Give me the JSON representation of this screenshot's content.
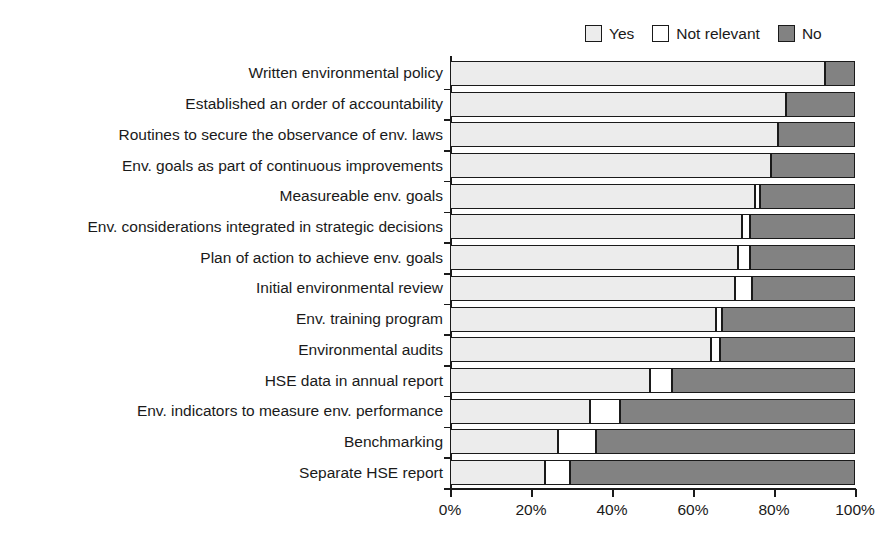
{
  "chart_data": {
    "type": "bar",
    "orientation": "horizontal",
    "stacked": true,
    "title": "",
    "subtitle": "",
    "xlabel": "",
    "ylabel": "",
    "xlim": [
      0,
      100
    ],
    "grid": false,
    "legend_position": "top-right",
    "xticks": [
      "0%",
      "20%",
      "40%",
      "60%",
      "80%",
      "100%"
    ],
    "xtick_values": [
      0,
      20,
      40,
      60,
      80,
      100
    ],
    "categories": [
      "Written environmental policy",
      "Established an order of accountability",
      "Routines to secure the observance of env. laws",
      "Env. goals as part of continuous improvements",
      "Measureable env. goals",
      "Env. considerations integrated in strategic decisions",
      "Plan of action to achieve env. goals",
      "Initial environmental review",
      "Env. training program",
      "Environmental audits",
      "HSE data in annual report",
      "Env. indicators to measure env. performance",
      "Benchmarking",
      "Separate HSE report"
    ],
    "series": [
      {
        "name": "Yes",
        "color": "#ececec",
        "values": [
          92.6,
          83.0,
          81.0,
          79.3,
          75.3,
          72.1,
          71.1,
          70.4,
          65.7,
          64.4,
          49.4,
          34.6,
          26.7,
          23.5
        ]
      },
      {
        "name": "Not relevant",
        "color": "#ffffff",
        "values": [
          0.0,
          0.0,
          0.0,
          0.0,
          1.2,
          2.0,
          3.0,
          4.2,
          1.5,
          2.2,
          5.4,
          7.4,
          9.4,
          6.2
        ]
      },
      {
        "name": "No",
        "color": "#828282",
        "values": [
          7.4,
          17.0,
          19.0,
          20.7,
          23.5,
          25.9,
          25.9,
          25.4,
          32.8,
          33.4,
          45.2,
          58.0,
          63.9,
          70.3
        ]
      }
    ]
  },
  "legend": {
    "entries": [
      {
        "label": "Yes",
        "color": "#ececec"
      },
      {
        "label": "Not relevant",
        "color": "#ffffff"
      },
      {
        "label": "No",
        "color": "#828282"
      }
    ]
  },
  "colors": {
    "yes": "#ececec",
    "not_relevant": "#ffffff",
    "no": "#828282",
    "axis": "#1a1a1a",
    "background": "#ffffff"
  }
}
